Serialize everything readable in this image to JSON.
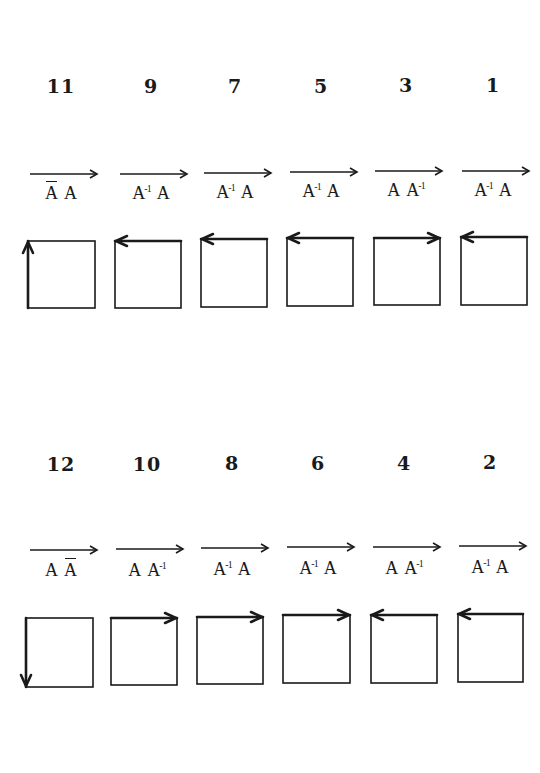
{
  "diagram": {
    "rows": [
      {
        "name": "top-row",
        "items": [
          {
            "number": "11",
            "left": 18,
            "num_y": 75,
            "arrow_y": 174,
            "label_y": 183,
            "box": {
              "x": 28,
              "y": 241,
              "w": 67,
              "h": 67
            },
            "terms": [
              {
                "base": "A",
                "bar": true,
                "sup": ""
              },
              {
                "base": "A",
                "bar": false,
                "sup": ""
              }
            ],
            "edge_arrow": "up-left"
          },
          {
            "number": "9",
            "left": 108,
            "num_y": 75,
            "arrow_y": 174,
            "label_y": 183,
            "box": {
              "x": 115,
              "y": 241,
              "w": 66,
              "h": 67
            },
            "terms": [
              {
                "base": "A",
                "bar": false,
                "sup": "-1"
              },
              {
                "base": "A",
                "bar": false,
                "sup": ""
              }
            ],
            "edge_arrow": "top-left"
          },
          {
            "number": "7",
            "left": 192,
            "num_y": 75,
            "arrow_y": 173,
            "label_y": 182,
            "box": {
              "x": 201,
              "y": 239,
              "w": 66,
              "h": 68
            },
            "terms": [
              {
                "base": "A",
                "bar": false,
                "sup": "-1"
              },
              {
                "base": "A",
                "bar": false,
                "sup": ""
              }
            ],
            "edge_arrow": "top-left"
          },
          {
            "number": "5",
            "left": 278,
            "num_y": 75,
            "arrow_y": 172,
            "label_y": 181,
            "box": {
              "x": 287,
              "y": 238,
              "w": 66,
              "h": 68
            },
            "terms": [
              {
                "base": "A",
                "bar": false,
                "sup": "-1"
              },
              {
                "base": "A",
                "bar": false,
                "sup": ""
              }
            ],
            "edge_arrow": "top-left"
          },
          {
            "number": "3",
            "left": 363,
            "num_y": 74,
            "arrow_y": 171,
            "label_y": 180,
            "box": {
              "x": 374,
              "y": 238,
              "w": 66,
              "h": 67
            },
            "terms": [
              {
                "base": "A",
                "bar": false,
                "sup": ""
              },
              {
                "base": "A",
                "bar": false,
                "sup": "-1"
              }
            ],
            "edge_arrow": "top-right"
          },
          {
            "number": "1",
            "left": 450,
            "num_y": 74,
            "arrow_y": 171,
            "label_y": 180,
            "box": {
              "x": 461,
              "y": 237,
              "w": 66,
              "h": 68
            },
            "terms": [
              {
                "base": "A",
                "bar": false,
                "sup": "-1"
              },
              {
                "base": "A",
                "bar": false,
                "sup": ""
              }
            ],
            "edge_arrow": "top-left"
          }
        ]
      },
      {
        "name": "bottom-row",
        "items": [
          {
            "number": "12",
            "left": 18,
            "num_y": 453,
            "arrow_y": 550,
            "label_y": 560,
            "box": {
              "x": 26,
              "y": 618,
              "w": 67,
              "h": 69
            },
            "terms": [
              {
                "base": "A",
                "bar": false,
                "sup": ""
              },
              {
                "base": "A",
                "bar": true,
                "sup": ""
              }
            ],
            "edge_arrow": "down-left"
          },
          {
            "number": "10",
            "left": 104,
            "num_y": 453,
            "arrow_y": 549,
            "label_y": 560,
            "box": {
              "x": 111,
              "y": 618,
              "w": 66,
              "h": 67
            },
            "terms": [
              {
                "base": "A",
                "bar": false,
                "sup": ""
              },
              {
                "base": "A",
                "bar": false,
                "sup": "-1"
              }
            ],
            "edge_arrow": "top-right"
          },
          {
            "number": "8",
            "left": 189,
            "num_y": 452,
            "arrow_y": 548,
            "label_y": 559,
            "box": {
              "x": 197,
              "y": 617,
              "w": 66,
              "h": 67
            },
            "terms": [
              {
                "base": "A",
                "bar": false,
                "sup": "-1"
              },
              {
                "base": "A",
                "bar": false,
                "sup": ""
              }
            ],
            "edge_arrow": "top-right"
          },
          {
            "number": "6",
            "left": 275,
            "num_y": 452,
            "arrow_y": 547,
            "label_y": 558,
            "box": {
              "x": 283,
              "y": 615,
              "w": 67,
              "h": 68
            },
            "terms": [
              {
                "base": "A",
                "bar": false,
                "sup": "-1"
              },
              {
                "base": "A",
                "bar": false,
                "sup": ""
              }
            ],
            "edge_arrow": "top-right"
          },
          {
            "number": "4",
            "left": 361,
            "num_y": 452,
            "arrow_y": 547,
            "label_y": 558,
            "box": {
              "x": 371,
              "y": 615,
              "w": 66,
              "h": 68
            },
            "terms": [
              {
                "base": "A",
                "bar": false,
                "sup": ""
              },
              {
                "base": "A",
                "bar": false,
                "sup": "-1"
              }
            ],
            "edge_arrow": "top-left"
          },
          {
            "number": "2",
            "left": 447,
            "num_y": 451,
            "arrow_y": 546,
            "label_y": 557,
            "box": {
              "x": 458,
              "y": 614,
              "w": 65,
              "h": 68
            },
            "terms": [
              {
                "base": "A",
                "bar": false,
                "sup": "-1"
              },
              {
                "base": "A",
                "bar": false,
                "sup": ""
              }
            ],
            "edge_arrow": "top-left"
          }
        ]
      }
    ],
    "colors": {
      "ink": "#1a1a1a",
      "background": "#ffffff"
    }
  }
}
